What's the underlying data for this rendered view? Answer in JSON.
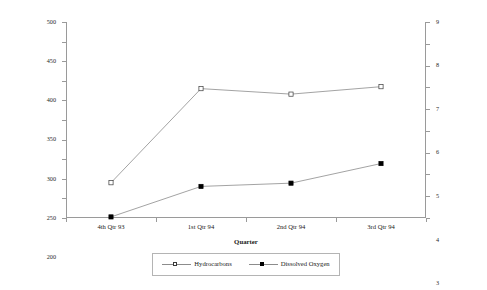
{
  "chart_data": {
    "type": "line",
    "title": "",
    "categories": [
      "4th Qtr 93",
      "1st Qtr 94",
      "2nd Qtr 94",
      "3rd Qtr 94"
    ],
    "xlabel": "Quarter",
    "ylabel": "Hydrocarbon Concentration by EPA Method 503.1 (µg/L)",
    "ylabel_right": "Dissolved Oxygen (mg/L)",
    "ylim": [
      0,
      500
    ],
    "ylim_right": [
      0,
      9
    ],
    "yticks": [
      0,
      50,
      100,
      150,
      200,
      250,
      300,
      350,
      400,
      450,
      500
    ],
    "yticks_right": [
      0,
      1,
      2,
      3,
      4,
      5,
      6,
      7,
      8,
      9
    ],
    "grid": false,
    "legend_position": "bottom",
    "series": [
      {
        "name": "Hydrocarbons",
        "axis": "left",
        "marker": "open-square",
        "values": [
          90,
          330,
          316,
          335
        ]
      },
      {
        "name": "Dissolved Oxygen",
        "axis": "right",
        "marker": "filled-square",
        "values": [
          0.05,
          1.45,
          1.6,
          2.5
        ]
      }
    ]
  },
  "axes": {
    "left_title_line1": "Hydrocarbon Concentration by EPA Method 503.1",
    "left_title_line2": "(µg/L)",
    "right_title": "Dissolved Oxygen (mg/L)",
    "x_title": "Quarter"
  },
  "legend": {
    "entries": [
      {
        "label": "Hydrocarbons",
        "marker": "open-square"
      },
      {
        "label": "Dissolved Oxygen",
        "marker": "filled-square"
      }
    ]
  },
  "colors": {
    "line": "#8c8c8c",
    "axis": "#9a9a9a",
    "text": "#1a1a1a",
    "marker_fill": "#000000",
    "marker_open": "#ffffff"
  }
}
